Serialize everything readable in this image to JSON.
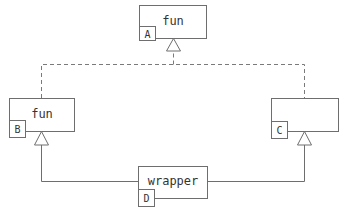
{
  "diagram": {
    "type": "class-inheritance",
    "nodes": [
      {
        "id": "A",
        "name": "fun",
        "tag": "A"
      },
      {
        "id": "B",
        "name": "fun",
        "tag": "B"
      },
      {
        "id": "C",
        "name": "",
        "tag": "C"
      },
      {
        "id": "D",
        "name": "wrapper",
        "tag": "D"
      }
    ],
    "edges": [
      {
        "from": "B",
        "to": "A",
        "style": "dashed",
        "arrow": "hollow-triangle"
      },
      {
        "from": "C",
        "to": "A",
        "style": "dashed",
        "arrow": "hollow-triangle"
      },
      {
        "from": "D",
        "to": "B",
        "style": "solid",
        "arrow": "hollow-triangle"
      },
      {
        "from": "D",
        "to": "C",
        "style": "solid",
        "arrow": "hollow-triangle"
      }
    ],
    "colors": {
      "stroke": "#6e6e6e",
      "text": "#333333",
      "background": "#ffffff"
    }
  }
}
